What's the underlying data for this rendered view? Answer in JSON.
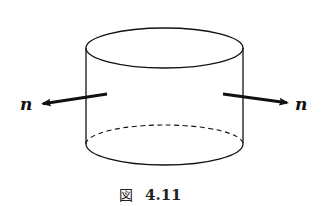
{
  "figure": {
    "caption_prefix": "図",
    "caption_number": "4.11",
    "labels": {
      "left_normal": "n",
      "right_normal": "n"
    },
    "colors": {
      "stroke": "#111111",
      "background": "#ffffff"
    },
    "geometry": {
      "cylinder": {
        "cx": 164.5,
        "rx": 78.5,
        "ry": 20,
        "top_cy": 48,
        "bottom_cy": 144
      },
      "left_arrow": {
        "x1": 107,
        "y1": 94,
        "x2": 41,
        "y2": 104
      },
      "right_arrow": {
        "x1": 223,
        "y1": 94,
        "x2": 289,
        "y2": 103
      }
    }
  }
}
